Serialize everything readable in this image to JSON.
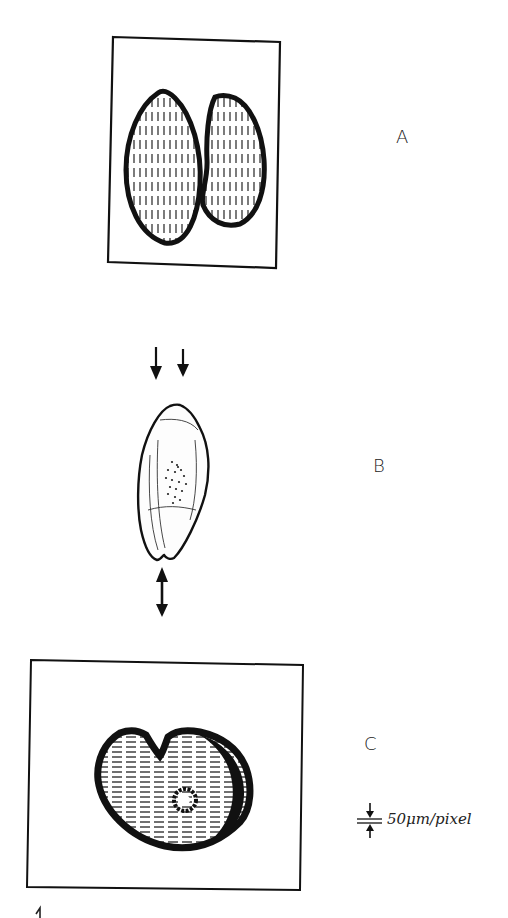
{
  "figure": {
    "panels": [
      {
        "id": "A",
        "label": "A",
        "description": "Two elongated grains side by side inside a framed box, hatched with vertical strokes"
      },
      {
        "id": "B",
        "label": "B",
        "description": "Single grain with dotted central region, compression arrows above and a double-headed arrow below"
      },
      {
        "id": "C",
        "label": "C",
        "description": "Cross-section with notch, horizontal hatching and a small central ring, inside a framed box"
      }
    ],
    "scale_bar": {
      "label": "50μm/pixel"
    },
    "footer_mark": "1"
  },
  "colors": {
    "ink": "#111111",
    "paper": "#ffffff"
  }
}
